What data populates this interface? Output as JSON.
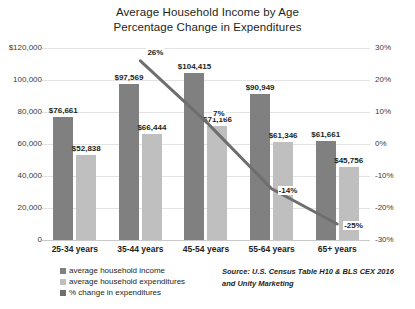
{
  "chart_data": {
    "type": "bar",
    "title": "Average Household Income by Age Percentage Change in Expenditures",
    "title_line1": "Average Household Income by Age",
    "title_line2": "Percentage Change in Expenditures",
    "xlabel": "",
    "ylabel": "",
    "categories": [
      "25-34 years",
      "35-44 years",
      "45-54 years",
      "55-64 years",
      "65+ years"
    ],
    "series": [
      {
        "name": "average household income",
        "type": "bar",
        "color": "#808080",
        "axis": "left",
        "values": [
          76661,
          97569,
          104415,
          90949,
          61661
        ],
        "labels": [
          "$76,661",
          "$97,569",
          "$104,415",
          "$90,949",
          "$61,661"
        ]
      },
      {
        "name": "average household expenditures",
        "type": "bar",
        "color": "#bfbfbf",
        "axis": "left",
        "values": [
          52838,
          66444,
          71166,
          61346,
          45756
        ],
        "labels": [
          "$52,838",
          "$66,444",
          "$71,166",
          "$61,346",
          "$45,756"
        ]
      },
      {
        "name": "% change in expenditures",
        "type": "line",
        "color": "#6e6e6e",
        "axis": "right",
        "values": [
          null,
          26,
          7,
          -14,
          -25
        ],
        "labels": [
          "",
          "26%",
          "7%",
          "-14%",
          "-25%"
        ]
      }
    ],
    "ylim": [
      0,
      120000
    ],
    "yticks": [
      0,
      20000,
      40000,
      60000,
      80000,
      100000,
      120000
    ],
    "ytick_labels": [
      "0",
      "20,000",
      "40,000",
      "60,000",
      "80,000",
      "100,000",
      "$120,000"
    ],
    "y2lim": [
      -30,
      30
    ],
    "y2ticks": [
      -30,
      -20,
      -10,
      0,
      10,
      20,
      30
    ],
    "y2tick_labels": [
      "-30%",
      "-20%",
      "-10%",
      "0%",
      "10%",
      "20%",
      "30%"
    ],
    "grid": true,
    "legend_position": "bottom-left",
    "annotations": {
      "source_line1": "Source: U.S. Census Table H10 & BLS CEX 2016",
      "source_line2": "and Unity Marketing"
    }
  }
}
